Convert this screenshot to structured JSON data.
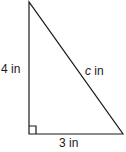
{
  "diagram": {
    "type": "right-triangle",
    "vertices": {
      "top": [
        29,
        2
      ],
      "right_angle": [
        29,
        134
      ],
      "right": [
        123,
        134
      ]
    },
    "stroke_color": "#1a1a1a",
    "sides": {
      "vertical": {
        "value": "4",
        "unit": "in",
        "label": "4 in"
      },
      "horizontal": {
        "value": "3",
        "unit": "in",
        "label": "3 in"
      },
      "hypotenuse": {
        "variable": "c",
        "unit": "in",
        "label": "c in"
      }
    },
    "right_angle_marker": true
  }
}
